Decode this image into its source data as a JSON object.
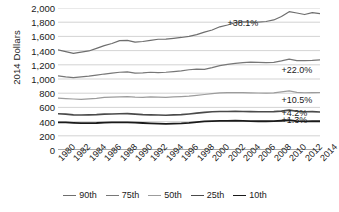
{
  "chart_data": {
    "type": "line",
    "title": "",
    "xlabel": "",
    "ylabel": "2014 Dollars",
    "ylim": [
      0,
      2000
    ],
    "ytick_step": 200,
    "yticks": [
      "0",
      "200",
      "400",
      "600",
      "800",
      "1,000",
      "1,200",
      "1,400",
      "1,600",
      "1,800",
      "2,000"
    ],
    "grid": "horizontal",
    "legend_position": "bottom",
    "xlim": [
      1980,
      2014
    ],
    "x": [
      1980,
      1981,
      1982,
      1983,
      1984,
      1985,
      1986,
      1987,
      1988,
      1989,
      1990,
      1991,
      1992,
      1993,
      1994,
      1995,
      1996,
      1997,
      1998,
      1999,
      2000,
      2001,
      2002,
      2003,
      2004,
      2005,
      2006,
      2007,
      2008,
      2009,
      2010,
      2011,
      2012,
      2013,
      2014
    ],
    "xtick_labels": [
      "1980",
      "1982",
      "1984",
      "1986",
      "1988",
      "1990",
      "1992",
      "1994",
      "1996",
      "1998",
      "2000",
      "2002",
      "2004",
      "2006",
      "2008",
      "2010",
      "2012",
      "2014"
    ],
    "series": [
      {
        "name": "90th",
        "color": "#6e6e6e",
        "width": 1.2,
        "annotation": "+38.1%",
        "annotation_value": 1790,
        "annotation_x": 2002,
        "values": [
          1410,
          1385,
          1360,
          1378,
          1395,
          1432,
          1470,
          1500,
          1540,
          1545,
          1520,
          1528,
          1545,
          1560,
          1562,
          1573,
          1585,
          1600,
          1625,
          1660,
          1690,
          1735,
          1760,
          1795,
          1805,
          1800,
          1802,
          1810,
          1832,
          1880,
          1948,
          1930,
          1908,
          1935,
          1920
        ]
      },
      {
        "name": "75th",
        "color": "#777777",
        "width": 1.2,
        "annotation": "+22.0%",
        "annotation_value": 1130,
        "annotation_x": 2009,
        "values": [
          1045,
          1030,
          1020,
          1030,
          1040,
          1055,
          1070,
          1082,
          1095,
          1100,
          1082,
          1085,
          1095,
          1090,
          1095,
          1105,
          1115,
          1130,
          1140,
          1135,
          1160,
          1188,
          1205,
          1220,
          1232,
          1238,
          1235,
          1232,
          1235,
          1255,
          1280,
          1260,
          1258,
          1262,
          1270
        ]
      },
      {
        "name": "50th",
        "color": "#9c9c9c",
        "width": 1.2,
        "annotation": "+10.5%",
        "annotation_value": 700,
        "annotation_x": 2009,
        "values": [
          730,
          725,
          718,
          713,
          720,
          728,
          742,
          745,
          748,
          752,
          745,
          742,
          748,
          745,
          742,
          748,
          752,
          758,
          770,
          782,
          795,
          805,
          808,
          810,
          808,
          805,
          803,
          802,
          805,
          818,
          832,
          812,
          806,
          808,
          810
        ]
      },
      {
        "name": "25th",
        "color": "#4a4a4a",
        "width": 1.6,
        "annotation": "+4.2%",
        "annotation_value": 520,
        "annotation_x": 2009,
        "values": [
          510,
          505,
          495,
          492,
          495,
          498,
          505,
          508,
          510,
          512,
          505,
          498,
          495,
          492,
          490,
          495,
          498,
          508,
          520,
          530,
          538,
          542,
          543,
          545,
          543,
          540,
          538,
          538,
          540,
          548,
          562,
          545,
          538,
          540,
          535
        ]
      },
      {
        "name": "10th",
        "color": "#1a1a1a",
        "width": 1.8,
        "annotation": "+1.3%",
        "annotation_value": 418,
        "annotation_x": 2009,
        "values": [
          390,
          388,
          382,
          378,
          378,
          380,
          385,
          388,
          390,
          390,
          385,
          380,
          375,
          372,
          368,
          372,
          375,
          382,
          392,
          402,
          408,
          410,
          410,
          412,
          410,
          408,
          405,
          405,
          406,
          412,
          420,
          408,
          402,
          405,
          405
        ]
      }
    ]
  },
  "axis": {
    "ylabel": "2014 Dollars"
  },
  "legend": {
    "items": [
      {
        "label": "90th"
      },
      {
        "label": "75th"
      },
      {
        "label": "50th"
      },
      {
        "label": "25th"
      },
      {
        "label": "10th"
      }
    ]
  }
}
